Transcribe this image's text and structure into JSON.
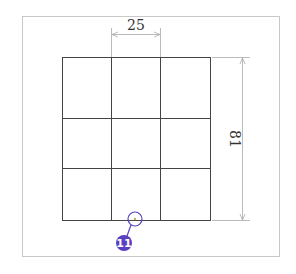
{
  "drawing": {
    "frame": {
      "x": 22,
      "y": 16,
      "w": 257,
      "h": 240,
      "color": "#c8c8c8"
    },
    "grid": {
      "rows": 3,
      "cols": 3,
      "x_lines": [
        62,
        111,
        160,
        210
      ],
      "y_lines": [
        57,
        118,
        168,
        220
      ],
      "color": "#444444"
    },
    "dimensions": {
      "horizontal": {
        "label": "25",
        "y": 34,
        "x1": 111,
        "x2": 160
      },
      "vertical": {
        "label": "81",
        "x": 242,
        "y1": 57,
        "y2": 220
      }
    },
    "callout": {
      "number": "11",
      "color": "#5a3fc0",
      "marker": {
        "cx": 135,
        "cy": 219,
        "r": 7
      },
      "badge": {
        "cx": 124,
        "cy": 243,
        "r": 8
      }
    }
  }
}
